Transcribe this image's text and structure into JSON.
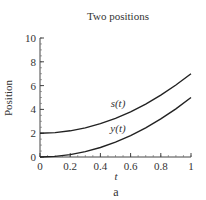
{
  "chart_data": {
    "type": "line",
    "title": "Two positions",
    "xlabel": "t",
    "ylabel": "Position",
    "caption": "a",
    "xlim": [
      0,
      1
    ],
    "ylim": [
      0,
      10
    ],
    "xticks": [
      "0",
      "0.2",
      "0.4",
      "0.6",
      "0.8",
      "1"
    ],
    "yticks": [
      "0",
      "2",
      "4",
      "6",
      "8",
      "10"
    ],
    "grid": false,
    "legend": "none",
    "x": [
      0,
      0.1,
      0.2,
      0.3,
      0.4,
      0.5,
      0.6,
      0.7,
      0.8,
      0.9,
      1.0
    ],
    "series": [
      {
        "name": "s(t)",
        "label": "s(t)",
        "values": [
          2.0,
          2.05,
          2.2,
          2.45,
          2.8,
          3.25,
          3.8,
          4.45,
          5.2,
          6.05,
          7.0
        ]
      },
      {
        "name": "y(t)",
        "label": "y(t)",
        "values": [
          0.0,
          0.05,
          0.2,
          0.45,
          0.8,
          1.25,
          1.8,
          2.45,
          3.2,
          4.05,
          5.0
        ]
      }
    ]
  }
}
